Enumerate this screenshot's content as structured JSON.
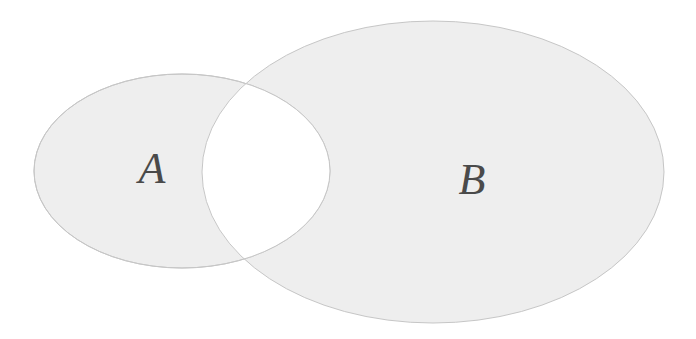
{
  "diagram": {
    "type": "venn",
    "shaded_region": "symmetric-difference",
    "colors": {
      "background": "#ffffff",
      "fill": "#eeeeee",
      "outline": "#c6c6c6",
      "label": "#4a4a4a",
      "intersection": "#ffffff"
    },
    "sets": [
      {
        "id": "A",
        "label": "A",
        "cx": 182,
        "cy": 171,
        "rx": 148,
        "ry": 97,
        "label_x": 152,
        "label_y": 183
      },
      {
        "id": "B",
        "label": "B",
        "cx": 433,
        "cy": 172,
        "rx": 231,
        "ry": 151,
        "label_x": 472,
        "label_y": 194
      }
    ]
  }
}
